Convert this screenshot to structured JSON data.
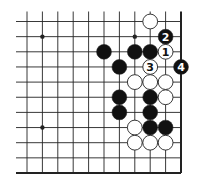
{
  "diagram": {
    "type": "go-board-fragment",
    "grid": {
      "columns": 11,
      "rows": 11,
      "origin_x": 27,
      "origin_y": 21.5,
      "spacing_x": 15.4,
      "spacing_y": 15.15,
      "right_edge": true,
      "bottom_edge": true,
      "left_edge": false,
      "top_edge": false
    },
    "colors": {
      "line": "#222222",
      "black_stone": "#111111",
      "white_stone": "#ffffff",
      "stone_outline": "#222222"
    },
    "star_points": [
      {
        "col": 1,
        "row": 1
      },
      {
        "col": 7,
        "row": 1
      },
      {
        "col": 1,
        "row": 7
      }
    ],
    "stones": [
      {
        "col": 8,
        "row": 0,
        "color": "white",
        "label": ""
      },
      {
        "col": 9,
        "row": 1,
        "color": "black",
        "label": "2"
      },
      {
        "col": 5,
        "row": 2,
        "color": "black",
        "label": ""
      },
      {
        "col": 7,
        "row": 2,
        "color": "black",
        "label": ""
      },
      {
        "col": 8,
        "row": 2,
        "color": "black",
        "label": ""
      },
      {
        "col": 9,
        "row": 2,
        "color": "white",
        "label": "1"
      },
      {
        "col": 6,
        "row": 3,
        "color": "black",
        "label": ""
      },
      {
        "col": 8,
        "row": 3,
        "color": "white",
        "label": "3"
      },
      {
        "col": 10,
        "row": 3,
        "color": "black",
        "label": "4"
      },
      {
        "col": 7,
        "row": 4,
        "color": "white",
        "label": ""
      },
      {
        "col": 8,
        "row": 4,
        "color": "white",
        "label": ""
      },
      {
        "col": 9,
        "row": 4,
        "color": "white",
        "label": ""
      },
      {
        "col": 6,
        "row": 5,
        "color": "black",
        "label": ""
      },
      {
        "col": 8,
        "row": 5,
        "color": "black",
        "label": ""
      },
      {
        "col": 9,
        "row": 5,
        "color": "white",
        "label": ""
      },
      {
        "col": 6,
        "row": 6,
        "color": "black",
        "label": ""
      },
      {
        "col": 8,
        "row": 6,
        "color": "black",
        "label": ""
      },
      {
        "col": 7,
        "row": 7,
        "color": "white",
        "label": ""
      },
      {
        "col": 8,
        "row": 7,
        "color": "black",
        "label": ""
      },
      {
        "col": 9,
        "row": 7,
        "color": "black",
        "label": ""
      },
      {
        "col": 7,
        "row": 8,
        "color": "white",
        "label": ""
      },
      {
        "col": 8,
        "row": 8,
        "color": "white",
        "label": ""
      },
      {
        "col": 9,
        "row": 8,
        "color": "white",
        "label": ""
      }
    ]
  }
}
